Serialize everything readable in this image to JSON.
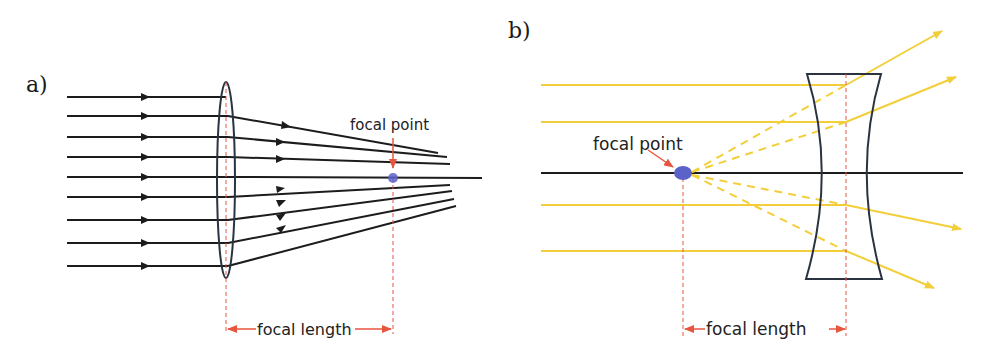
{
  "panels": {
    "a": {
      "label": "a)",
      "lens_type": "convex",
      "focal_point_label": "focal point",
      "focal_length_label": "focal length"
    },
    "b": {
      "label": "b)",
      "lens_type": "concave",
      "focal_point_label": "focal point",
      "focal_length_label": "focal length"
    }
  },
  "colors": {
    "ray_a": "#1c1c1c",
    "ray_b": "#f2cf3a",
    "lens_outline": "#2b3240",
    "focal_dot": "#5b63c9",
    "annotation_red": "#e8553f",
    "axis": "#1c1c1c"
  }
}
